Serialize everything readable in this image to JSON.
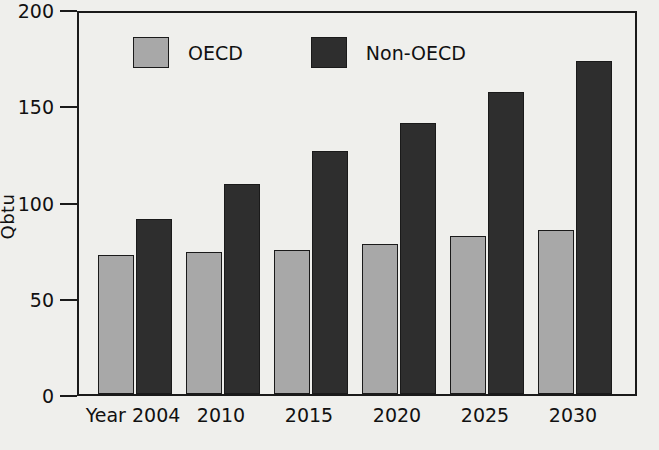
{
  "chart_data": {
    "type": "bar",
    "title": "",
    "xlabel": "",
    "ylabel": "Qbtu",
    "ylim": [
      0,
      200
    ],
    "yticks": [
      0,
      50,
      100,
      150,
      200
    ],
    "grid": false,
    "legend_position": "top-left-inside",
    "categories": [
      "Year 2004",
      "2010",
      "2015",
      "2020",
      "2025",
      "2030"
    ],
    "series": [
      {
        "name": "OECD",
        "color": "#a8a8a8",
        "values": [
          72,
          74,
          75,
          78,
          82,
          85
        ]
      },
      {
        "name": "Non-OECD",
        "color": "#2e2e2e",
        "values": [
          91,
          109,
          126,
          141,
          157,
          173
        ]
      }
    ]
  },
  "axis": {
    "y_tick_labels": [
      "200",
      "150",
      "100",
      "50",
      "0"
    ],
    "y_title": "Qbtu"
  },
  "legend": {
    "items": [
      {
        "label": "OECD",
        "color": "#a8a8a8"
      },
      {
        "label": "Non-OECD",
        "color": "#2e2e2e"
      }
    ]
  }
}
